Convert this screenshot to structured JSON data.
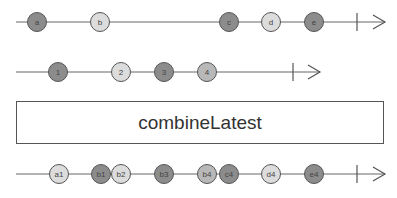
{
  "diagram": {
    "type": "marble-diagram",
    "operator_label": "combineLatest",
    "colors": {
      "dark": "#8c8c8c",
      "light": "#dcdcdc",
      "mid": "#b8b8b8",
      "stroke": "#555555",
      "line": "#666666"
    },
    "streams": [
      {
        "name": "source-1",
        "y": 22,
        "line_start": 16,
        "complete_x": 357,
        "arrow_end": 385,
        "marbles": [
          {
            "label": "a",
            "x": 37,
            "shade": "dark"
          },
          {
            "label": "b",
            "x": 100,
            "shade": "light"
          },
          {
            "label": "c",
            "x": 229,
            "shade": "dark"
          },
          {
            "label": "d",
            "x": 271,
            "shade": "light"
          },
          {
            "label": "e",
            "x": 314,
            "shade": "dark"
          }
        ]
      },
      {
        "name": "source-2",
        "y": 72,
        "line_start": 16,
        "complete_x": 293,
        "arrow_end": 320,
        "marbles": [
          {
            "label": "1",
            "x": 58,
            "shade": "dark"
          },
          {
            "label": "2",
            "x": 121,
            "shade": "light"
          },
          {
            "label": "3",
            "x": 164,
            "shade": "dark"
          },
          {
            "label": "4",
            "x": 207,
            "shade": "mid"
          }
        ]
      },
      {
        "name": "output",
        "y": 174,
        "line_start": 16,
        "complete_x": 357,
        "arrow_end": 385,
        "marbles": [
          {
            "label": "a1",
            "x": 59,
            "shade": "light"
          },
          {
            "label": "b1",
            "x": 101,
            "shade": "dark"
          },
          {
            "label": "b2",
            "x": 121,
            "shade": "light"
          },
          {
            "label": "b3",
            "x": 164,
            "shade": "dark"
          },
          {
            "label": "b4",
            "x": 207,
            "shade": "mid"
          },
          {
            "label": "c4",
            "x": 229,
            "shade": "dark"
          },
          {
            "label": "d4",
            "x": 271,
            "shade": "light"
          },
          {
            "label": "e4",
            "x": 314,
            "shade": "dark"
          }
        ]
      }
    ]
  }
}
